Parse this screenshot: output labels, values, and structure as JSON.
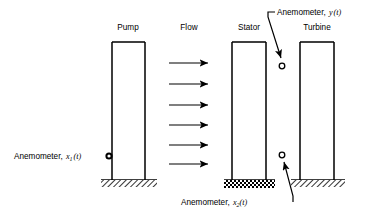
{
  "diagram": {
    "background": "#ffffff",
    "ink": "#000000"
  },
  "components": {
    "pump": {
      "label": "Pump",
      "base_pattern": "diagonal-hatch"
    },
    "stator": {
      "label": "Stator",
      "base_pattern": "checkered-isolator"
    },
    "turbine": {
      "label": "Turbine",
      "base_pattern": "diagonal-hatch"
    }
  },
  "flow": {
    "label": "Flow",
    "arrow_count": 6,
    "direction": "left-to-right"
  },
  "sensors": [
    {
      "id": "x1",
      "label_text": "Anemometer, ",
      "symbol": "x",
      "subscript": "1",
      "arg": "(t)",
      "marker": "filled-circle",
      "position": "left-of-pump"
    },
    {
      "id": "y",
      "label_text": "Anemometer, ",
      "symbol": "y",
      "subscript": "",
      "arg": "(t)",
      "marker": "open-circle",
      "position": "upper-right-between-stator-and-turbine"
    },
    {
      "id": "x2",
      "label_text": "Anemometer, ",
      "symbol": "x",
      "subscript": "2",
      "arg": "(t)",
      "marker": "open-circle",
      "position": "lower-right-between-stator-and-turbine"
    }
  ]
}
